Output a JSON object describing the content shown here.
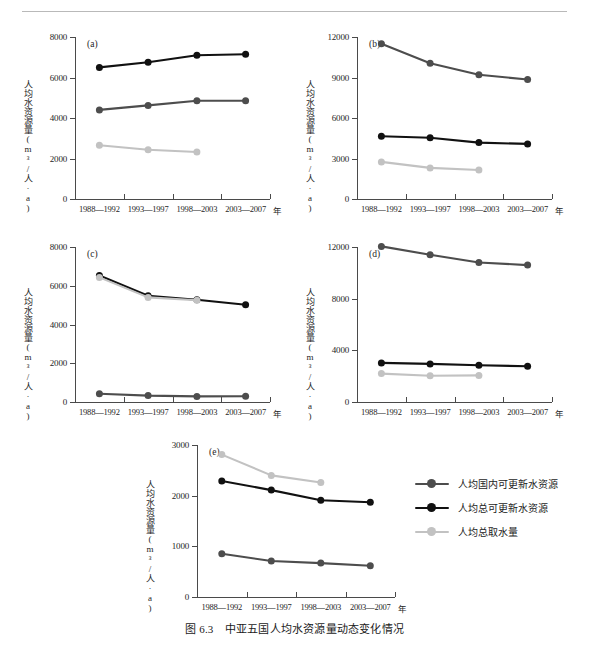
{
  "figure": {
    "caption": "图 6.3　中亚五国人均水资源量动态变化情况",
    "x_unit_label": "年",
    "y_axis_label": "人均水资源量(m³/人·a)",
    "categories": [
      "1988—1992",
      "1993—1997",
      "1998—2003",
      "2003—2007"
    ]
  },
  "legend": {
    "items": [
      {
        "label": "人均国内可更新水资源",
        "color": "#4d4d4d"
      },
      {
        "label": "人均总可更新水资源",
        "color": "#111111"
      },
      {
        "label": "人均总取水量",
        "color": "#c2c2c2"
      }
    ]
  },
  "chart_data": [
    {
      "type": "line",
      "panel": "(a)",
      "title": "",
      "xlabel": "年",
      "ylabel": "人均水资源量(m³/人·a)",
      "x": [
        "1988—1992",
        "1993—1997",
        "1998—2003",
        "2003—2007"
      ],
      "ylim": [
        0,
        8000
      ],
      "yticks": [
        0,
        2000,
        4000,
        6000,
        8000
      ],
      "grid": false,
      "series": [
        {
          "name": "人均总可更新水资源",
          "color": "#111111",
          "values": [
            6500,
            6750,
            7100,
            7150
          ]
        },
        {
          "name": "人均国内可更新水资源",
          "color": "#4d4d4d",
          "values": [
            4400,
            4620,
            4850,
            4850
          ]
        },
        {
          "name": "人均总取水量",
          "color": "#c2c2c2",
          "values": [
            2650,
            2430,
            2320,
            null
          ]
        }
      ]
    },
    {
      "type": "line",
      "panel": "(b)",
      "title": "",
      "xlabel": "年",
      "ylabel": "人均水资源量(m³/人·a)",
      "x": [
        "1988—1992",
        "1993—1997",
        "1998—2003",
        "2003—2007"
      ],
      "ylim": [
        0,
        12000
      ],
      "yticks": [
        0,
        3000,
        6000,
        9000,
        12000
      ],
      "grid": false,
      "series": [
        {
          "name": "人均国内可更新水资源",
          "color": "#4d4d4d",
          "values": [
            11500,
            10050,
            9200,
            8850
          ]
        },
        {
          "name": "人均总可更新水资源",
          "color": "#111111",
          "values": [
            4650,
            4540,
            4180,
            4080
          ]
        },
        {
          "name": "人均总取水量",
          "color": "#c2c2c2",
          "values": [
            2750,
            2300,
            2150,
            null
          ]
        }
      ]
    },
    {
      "type": "line",
      "panel": "(c)",
      "title": "",
      "xlabel": "年",
      "ylabel": "人均水资源量(m³/人·a)",
      "x": [
        "1988—1992",
        "1993—1997",
        "1998—2003",
        "2003—2007"
      ],
      "ylim": [
        0,
        8000
      ],
      "yticks": [
        0,
        2000,
        4000,
        6000,
        8000
      ],
      "grid": false,
      "series": [
        {
          "name": "人均总可更新水资源",
          "color": "#111111",
          "values": [
            6530,
            5480,
            5280,
            5020
          ]
        },
        {
          "name": "人均总取水量",
          "color": "#c2c2c2",
          "values": [
            6430,
            5400,
            5250,
            null
          ]
        },
        {
          "name": "人均国内可更新水资源",
          "color": "#4d4d4d",
          "values": [
            430,
            330,
            290,
            300
          ]
        }
      ]
    },
    {
      "type": "line",
      "panel": "(d)",
      "title": "",
      "xlabel": "年",
      "ylabel": "人均水资源量(m³/人·a)",
      "x": [
        "1988—1992",
        "1993—1997",
        "1998—2003",
        "2003—2007"
      ],
      "ylim": [
        0,
        12000
      ],
      "yticks": [
        0,
        4000,
        8000,
        12000
      ],
      "grid": false,
      "series": [
        {
          "name": "人均国内可更新水资源",
          "color": "#4d4d4d",
          "values": [
            12050,
            11400,
            10800,
            10600
          ]
        },
        {
          "name": "人均总可更新水资源",
          "color": "#111111",
          "values": [
            3030,
            2950,
            2850,
            2760
          ]
        },
        {
          "name": "人均总取水量",
          "color": "#c2c2c2",
          "values": [
            2200,
            2030,
            2060,
            null
          ]
        }
      ]
    },
    {
      "type": "line",
      "panel": "(e)",
      "title": "",
      "xlabel": "年",
      "ylabel": "人均水资源量(m³/人·a)",
      "x": [
        "1988—1992",
        "1993—1997",
        "1998—2003",
        "2003—2007"
      ],
      "ylim": [
        0,
        3000
      ],
      "yticks": [
        0,
        1000,
        2000,
        3000
      ],
      "grid": false,
      "series": [
        {
          "name": "人均总取水量",
          "color": "#c2c2c2",
          "values": [
            2810,
            2400,
            2260,
            null
          ]
        },
        {
          "name": "人均总可更新水资源",
          "color": "#111111",
          "values": [
            2290,
            2110,
            1910,
            1870
          ]
        },
        {
          "name": "人均国内可更新水资源",
          "color": "#4d4d4d",
          "values": [
            855,
            710,
            670,
            615
          ]
        }
      ]
    }
  ]
}
